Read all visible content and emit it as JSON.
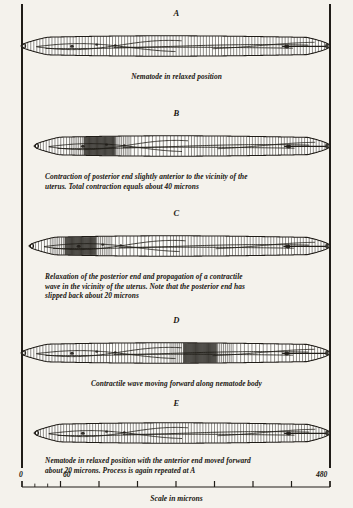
{
  "figure": {
    "background_color": "#f4f2ec",
    "ink_color": "#201d18",
    "reference_lines": {
      "left_label": "left-reference-line",
      "right_label": "right-reference-line"
    }
  },
  "panels": [
    {
      "letter": "A",
      "caption": "Nematode in relaxed position",
      "caption_style": "center",
      "body_start": 21,
      "body_end": 330,
      "contraction_band": null
    },
    {
      "letter": "B",
      "caption": "Contraction of posterior end slightly anterior to the vicinity of the\nuterus.   Total contraction equals about 40 microns",
      "caption_style": "block",
      "body_start": 34,
      "body_end": 330,
      "contraction_band": 0.22
    },
    {
      "letter": "C",
      "caption": "Relaxation of the posterior end and propagation of a contractile\nwave in the vicinity of the uterus.   Note that the posterior end has\nslipped back about 20 microns",
      "caption_style": "block",
      "body_start": 29,
      "body_end": 330,
      "contraction_band": 0.17
    },
    {
      "letter": "D",
      "caption": "Contractile wave moving forward along nematode body",
      "caption_style": "center",
      "body_start": 21,
      "body_end": 330,
      "contraction_band": 0.58
    },
    {
      "letter": "E",
      "caption": "Nematode in relaxed position with the anterior end moved forward\nabout 20 microns.   Process is again repeated at A",
      "caption_style": "block",
      "body_start": 34,
      "body_end": 330,
      "contraction_band": null
    }
  ],
  "scale": {
    "caption": "Scale in microns",
    "min_label": "0",
    "mid_label": "60",
    "max_label": "480",
    "min_value": 0,
    "max_value": 480,
    "major_interval": 60,
    "minor_interval": 20
  }
}
